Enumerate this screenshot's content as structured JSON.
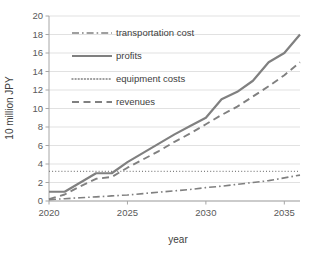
{
  "chart_data": {
    "type": "line",
    "title": "",
    "xlabel": "year",
    "ylabel": "10 million JPY",
    "xlim": [
      2020,
      2036
    ],
    "ylim": [
      0,
      20
    ],
    "grid": "horizontal",
    "legend_position": "upper-left-inside",
    "x_ticks": [
      "2020",
      "2025",
      "2030",
      "2035"
    ],
    "x_tick_values": [
      2020,
      2025,
      2030,
      2035
    ],
    "y_ticks": [
      "0",
      "2",
      "4",
      "6",
      "8",
      "10",
      "12",
      "14",
      "16",
      "18",
      "20"
    ],
    "y_tick_values": [
      0,
      2,
      4,
      6,
      8,
      10,
      12,
      14,
      16,
      18,
      20
    ],
    "x": [
      2020,
      2021,
      2022,
      2023,
      2024,
      2025,
      2026,
      2027,
      2028,
      2029,
      2030,
      2031,
      2032,
      2033,
      2034,
      2035,
      2036
    ],
    "series": [
      {
        "name": "transportation cost",
        "style": "dashdot",
        "color": "#808080",
        "width": 1.6,
        "values": [
          0.15,
          0.25,
          0.35,
          0.45,
          0.55,
          0.65,
          0.8,
          0.95,
          1.1,
          1.25,
          1.45,
          1.6,
          1.8,
          2.0,
          2.2,
          2.5,
          2.8
        ]
      },
      {
        "name": "profits",
        "style": "solid",
        "color": "#808080",
        "width": 2.2,
        "values": [
          1.0,
          1.0,
          2.0,
          3.0,
          3.0,
          4.2,
          5.2,
          6.2,
          7.2,
          8.1,
          9.0,
          11.0,
          11.8,
          13.0,
          15.0,
          16.0,
          18.0
        ]
      },
      {
        "name": "equipment costs",
        "style": "dotted",
        "color": "#808080",
        "width": 1.4,
        "values": [
          3.2,
          3.2,
          3.2,
          3.2,
          3.2,
          3.2,
          3.2,
          3.2,
          3.2,
          3.2,
          3.2,
          3.2,
          3.2,
          3.2,
          3.2,
          3.2,
          3.2
        ]
      },
      {
        "name": "revenues",
        "style": "dashed",
        "color": "#808080",
        "width": 1.9,
        "values": [
          0.2,
          0.7,
          1.6,
          2.4,
          2.6,
          3.6,
          4.5,
          5.4,
          6.4,
          7.3,
          8.3,
          9.3,
          10.2,
          11.3,
          12.4,
          13.6,
          15.0
        ]
      }
    ]
  },
  "legend": {
    "items": [
      {
        "label": "transportation cost"
      },
      {
        "label": "profits"
      },
      {
        "label": "equipment costs"
      },
      {
        "label": "revenues"
      }
    ]
  },
  "colors": {
    "series": "#808080",
    "grid": "#d9d9d9",
    "axis": "#a6a6a6",
    "text": "#404040",
    "background": "#ffffff"
  }
}
